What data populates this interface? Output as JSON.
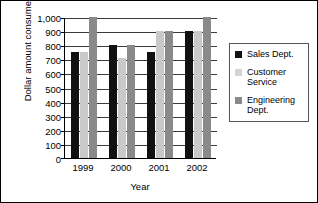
{
  "chart_data": {
    "type": "bar",
    "title": "",
    "xlabel": "Year",
    "ylabel": "Dollar amount consumed",
    "categories": [
      "1999",
      "2000",
      "2001",
      "2002"
    ],
    "ylim": [
      0,
      1000
    ],
    "ytick_step": 100,
    "ytick_labels": [
      "1,000",
      "900",
      "800",
      "700",
      "600",
      "500",
      "400",
      "300",
      "200",
      "100",
      "0"
    ],
    "grid": "horizontal",
    "legend_position": "right",
    "series": [
      {
        "name": "Sales Dept.",
        "color": "#111111",
        "values": [
          750,
          800,
          750,
          900
        ]
      },
      {
        "name": "Customer Service",
        "color": "#c9c9c9",
        "values": [
          750,
          710,
          900,
          900
        ]
      },
      {
        "name": "Engineering Dept.",
        "color": "#8a8a8a",
        "values": [
          1000,
          800,
          900,
          1000
        ]
      }
    ]
  },
  "legend": {
    "items": [
      {
        "label": "Sales Dept.",
        "swatch": "legend-swatch-sales"
      },
      {
        "label": "Customer Service",
        "swatch": "legend-swatch-customer-service"
      },
      {
        "label": "Engineering Dept.",
        "swatch": "legend-swatch-engineering"
      }
    ]
  }
}
